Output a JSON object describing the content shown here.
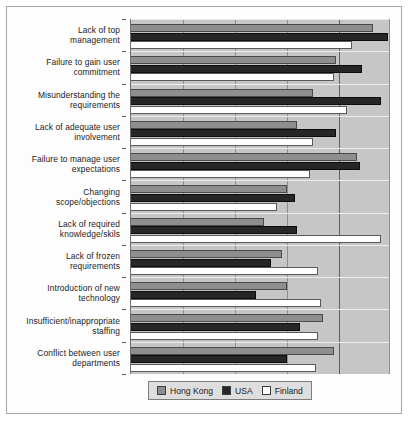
{
  "chart_data": {
    "type": "bar",
    "orientation": "horizontal",
    "title": "",
    "xlabel": "",
    "ylabel": "",
    "grid": true,
    "legend_position": "bottom",
    "xlim": [
      0,
      100
    ],
    "gridline_values": [
      20,
      40,
      60,
      80,
      100
    ],
    "categories": [
      "Lack of top management",
      "Failure to gain user commitment",
      "Misunderstanding the requirements",
      "Lack of adequate user involvement",
      "Failure to manage user expectations",
      "Changing scope/objections",
      "Lack of required knowledge/skils",
      "Lack of frozen requirements",
      "Introduction of new technology",
      "Insufficient/inappropriate staffing",
      "Conflict between user departments"
    ],
    "series": [
      {
        "name": "Hong Kong",
        "color": "#8e8e8e",
        "values": [
          93,
          79,
          70,
          64,
          87,
          60,
          51,
          58,
          60,
          74,
          78
        ]
      },
      {
        "name": "USA",
        "color": "#262626",
        "values": [
          99,
          89,
          96,
          79,
          88,
          63,
          64,
          54,
          48,
          65,
          60
        ]
      },
      {
        "name": "Finland",
        "color": "#ffffff",
        "values": [
          85,
          78,
          83,
          70,
          69,
          56,
          96,
          72,
          73,
          72,
          71
        ]
      }
    ]
  },
  "legend": {
    "items": [
      {
        "label": "Hong Kong",
        "color": "#8e8e8e"
      },
      {
        "label": "USA",
        "color": "#262626"
      },
      {
        "label": "Finland",
        "color": "#ffffff"
      }
    ]
  },
  "ylabels": [
    {
      "line1": "Lack of top",
      "line2": "management"
    },
    {
      "line1": "Failure to gain user",
      "line2": "commitment"
    },
    {
      "line1": "Misunderstanding the",
      "line2": "requirements"
    },
    {
      "line1": "Lack of adequate user",
      "line2": "involvement"
    },
    {
      "line1": "Failure to manage user",
      "line2": "expectations"
    },
    {
      "line1": "Changing",
      "line2": "scope/objections"
    },
    {
      "line1": "Lack of required",
      "line2": "knowledge/skils"
    },
    {
      "line1": "Lack of frozen",
      "line2": "requirements"
    },
    {
      "line1": "Introduction of new",
      "line2": "technology"
    },
    {
      "line1": "Insufficient/inappropriate",
      "line2": "staffing"
    },
    {
      "line1": "Conflict between user",
      "line2": "departments"
    }
  ]
}
